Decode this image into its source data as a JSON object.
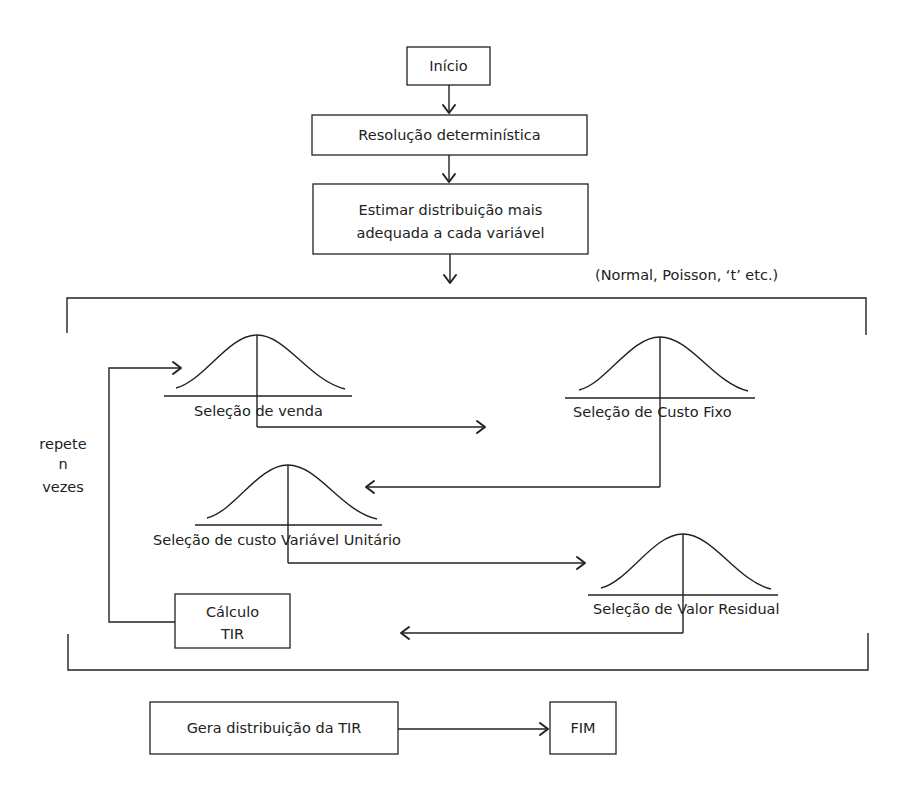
{
  "diagram": {
    "type": "flowchart",
    "nodes": {
      "start": {
        "label": "Início"
      },
      "deterministic": {
        "label": "Resolução determinística"
      },
      "estimate": {
        "line1": "Estimar distribuição mais",
        "line2": "adequada a cada variável"
      },
      "distributions_note": {
        "label": "(Normal, Poisson, ‘t’ etc.)"
      },
      "loop_note": {
        "line1": "repete",
        "line2": "n",
        "line3": "vezes"
      },
      "sel_sales": {
        "label": "Seleção de venda"
      },
      "sel_fixed_cost": {
        "label": "Seleção de Custo Fixo"
      },
      "sel_variable_cost": {
        "label": "Seleção de custo Variável Unitário"
      },
      "sel_residual": {
        "label": "Seleção de Valor Residual"
      },
      "calc_irr": {
        "line1": "Cálculo",
        "line2": "TIR"
      },
      "gen_irr_dist": {
        "label": "Gera distribuição da TIR"
      },
      "end": {
        "label": "FIM"
      }
    },
    "edges": [
      {
        "from": "Início",
        "to": "Resolução determinística"
      },
      {
        "from": "Resolução determinística",
        "to": "Estimar distribuição mais adequada a cada variável"
      },
      {
        "from": "Estimar distribuição mais adequada a cada variável",
        "to": "simulation-loop"
      },
      {
        "from": "Seleção de venda",
        "to": "Seleção de Custo Fixo"
      },
      {
        "from": "Seleção de Custo Fixo",
        "to": "Seleção de custo Variável Unitário"
      },
      {
        "from": "Seleção de custo Variável Unitário",
        "to": "Seleção de Valor Residual"
      },
      {
        "from": "Seleção de Valor Residual",
        "to": "Cálculo TIR"
      },
      {
        "from": "Cálculo TIR",
        "to": "Seleção de venda",
        "label": "repete n vezes"
      },
      {
        "from": "Gera distribuição da TIR",
        "to": "FIM"
      }
    ]
  }
}
